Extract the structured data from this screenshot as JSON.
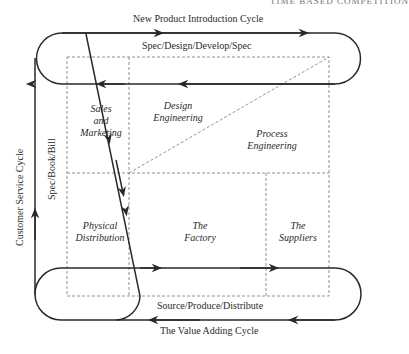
{
  "header": {
    "running_title": "TIME BASED COMPETITION"
  },
  "cycles": {
    "new_product": {
      "title": "New Product Introduction Cycle",
      "subtitle": "Spec/Design/Develop/Spec"
    },
    "customer_service": {
      "title": "Customer Service Cycle",
      "subtitle": "Spec/Book/Bill"
    },
    "value_adding": {
      "title": "The Value Adding Cycle",
      "subtitle": "Source/Produce/Distribute"
    }
  },
  "functions": {
    "sales_marketing": {
      "line1": "Sales",
      "line2": "and",
      "line3": "Marketing"
    },
    "design_engineering": {
      "line1": "Design",
      "line2": "Engineering"
    },
    "process_engineering": {
      "line1": "Process",
      "line2": "Engineering"
    },
    "physical_distribution": {
      "line1": "Physical",
      "line2": "Distribution"
    },
    "factory": {
      "line1": "The",
      "line2": "Factory"
    },
    "suppliers": {
      "line1": "The",
      "line2": "Suppliers"
    }
  },
  "colors": {
    "line": "#2a2a2a",
    "dashed": "#777777",
    "background": "#ffffff"
  }
}
